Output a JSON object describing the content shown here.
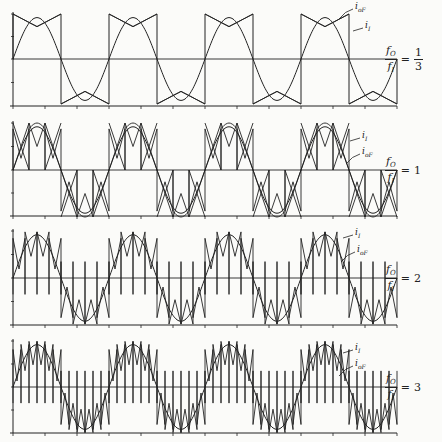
{
  "figure": {
    "colors": {
      "ink": "#222222",
      "background": "#fbfbf9"
    },
    "x_axis": {
      "x_start": 13,
      "x_end": 397,
      "tick_spacing": 32
    },
    "panels": [
      {
        "id": "ratio-1-3",
        "ratio_num": "1",
        "ratio_den": "3",
        "ratio_text": "1/3",
        "ratio_display": "1/3",
        "value_label_is_fraction": true,
        "top": 14,
        "zero": 59,
        "bottom": 106,
        "output_period_px": 96,
        "label_ioF": {
          "text": "i",
          "sub": "oF",
          "x": 355,
          "y": 3
        },
        "label_iI": {
          "text": "i",
          "sub": "I",
          "x": 365,
          "y": 22
        }
      },
      {
        "id": "ratio-1",
        "ratio_display": "1",
        "value_label_is_fraction": false,
        "top": 123,
        "zero": 170,
        "bottom": 216,
        "output_period_px": 96,
        "label_ioF": {
          "text": "i",
          "sub": "oF",
          "x": 362,
          "y": 148
        },
        "label_iI": {
          "text": "i",
          "sub": "I",
          "x": 362,
          "y": 132
        }
      },
      {
        "id": "ratio-2",
        "ratio_display": "2",
        "value_label_is_fraction": false,
        "top": 231,
        "zero": 278,
        "bottom": 325,
        "output_period_px": 144,
        "label_ioF": {
          "text": "i",
          "sub": "oF",
          "x": 357,
          "y": 246
        },
        "label_iI": {
          "text": "i",
          "sub": "I",
          "x": 355,
          "y": 229
        }
      },
      {
        "id": "ratio-3",
        "ratio_display": "3",
        "value_label_is_fraction": false,
        "top": 341,
        "zero": 387,
        "bottom": 433,
        "output_period_px": 96,
        "label_ioF": {
          "text": "i",
          "sub": "oF",
          "x": 355,
          "y": 360
        },
        "label_iI": {
          "text": "i",
          "sub": "I",
          "x": 355,
          "y": 344
        }
      }
    ],
    "ratio_prefix_num": "f",
    "ratio_prefix_num_sub": "O",
    "ratio_prefix_den": "f",
    "ratio_prefix_den_sub": "I",
    "equals": "="
  },
  "chart_data": {
    "type": "line",
    "title": "",
    "xlabel": "time",
    "ylabel": "current",
    "grid": false,
    "panels": [
      {
        "ratio": "f_O/f_I = 1/3",
        "series": [
          {
            "name": "i_oF",
            "shape": "sinusoid"
          },
          {
            "name": "i_I",
            "shape": "quasi-square with cusped segments"
          }
        ]
      },
      {
        "ratio": "f_O/f_I = 1",
        "series": [
          {
            "name": "i_oF",
            "shape": "sinusoid"
          },
          {
            "name": "i_I",
            "shape": "chopped segments with crossing cusps"
          }
        ]
      },
      {
        "ratio": "f_O/f_I = 2",
        "series": [
          {
            "name": "i_oF",
            "shape": "sinusoid"
          },
          {
            "name": "i_I",
            "shape": "high-ripple chopped segments"
          }
        ]
      },
      {
        "ratio": "f_O/f_I = 3",
        "series": [
          {
            "name": "i_oF",
            "shape": "sinusoid"
          },
          {
            "name": "i_I",
            "shape": "high-ripple chopped segments"
          }
        ]
      }
    ]
  }
}
